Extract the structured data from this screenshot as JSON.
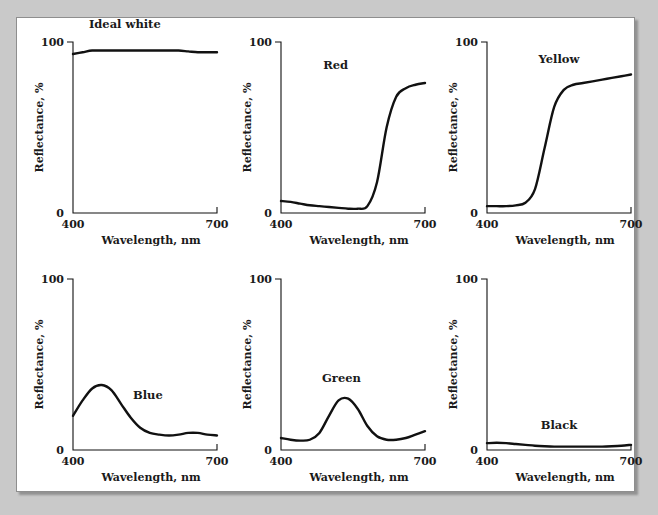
{
  "figure": {
    "background_color": "#c9c9c9",
    "page_color": "#ffffff",
    "border_color": "#8e8e8e",
    "curve_color": "#111111"
  },
  "chart_data": [
    {
      "type": "line",
      "title": "Ideal white",
      "xlabel": "Wavelength, nm",
      "ylabel": "Reflectance, %",
      "xlim": [
        400,
        700
      ],
      "ylim": [
        0,
        100
      ],
      "xticks": [
        "400",
        "700"
      ],
      "yticks": [
        "0",
        "100"
      ],
      "grid": false,
      "legend": "none",
      "x": [
        400,
        420,
        440,
        460,
        480,
        500,
        520,
        540,
        560,
        580,
        600,
        620,
        640,
        660,
        680,
        700
      ],
      "values": [
        93,
        94,
        95,
        95,
        95,
        95,
        95,
        95,
        95,
        95,
        95,
        95,
        94.5,
        94,
        94,
        94
      ]
    },
    {
      "type": "line",
      "title": "Red",
      "xlabel": "Wavelength, nm",
      "ylabel": "Reflectance, %",
      "xlim": [
        400,
        700
      ],
      "ylim": [
        0,
        100
      ],
      "xticks": [
        "400",
        "700"
      ],
      "yticks": [
        "0",
        "100"
      ],
      "grid": false,
      "legend": "none",
      "x": [
        400,
        420,
        440,
        460,
        480,
        500,
        520,
        540,
        560,
        580,
        600,
        620,
        640,
        660,
        680,
        700
      ],
      "values": [
        7,
        6.5,
        5.5,
        4.5,
        4,
        3.5,
        3,
        2.5,
        2.5,
        4,
        18,
        50,
        68,
        73,
        75,
        76
      ]
    },
    {
      "type": "line",
      "title": "Yellow",
      "xlabel": "Wavelength, nm",
      "ylabel": "Reflectance, %",
      "xlim": [
        400,
        700
      ],
      "ylim": [
        0,
        100
      ],
      "xticks": [
        "400",
        "700"
      ],
      "yticks": [
        "0",
        "100"
      ],
      "grid": false,
      "legend": "none",
      "x": [
        400,
        420,
        440,
        460,
        480,
        500,
        520,
        540,
        560,
        580,
        600,
        620,
        640,
        660,
        680,
        700
      ],
      "values": [
        4,
        4,
        4,
        4.5,
        6,
        14,
        38,
        62,
        72,
        75,
        76,
        77,
        78,
        79,
        80,
        81
      ]
    },
    {
      "type": "line",
      "title": "Blue",
      "xlabel": "Wavelength, nm",
      "ylabel": "Reflectance, %",
      "xlim": [
        400,
        700
      ],
      "ylim": [
        0,
        100
      ],
      "xticks": [
        "400",
        "700"
      ],
      "yticks": [
        "0",
        "100"
      ],
      "grid": false,
      "legend": "none",
      "x": [
        400,
        420,
        440,
        460,
        480,
        500,
        520,
        540,
        560,
        580,
        600,
        620,
        640,
        660,
        680,
        700
      ],
      "values": [
        20,
        29,
        36,
        38,
        35,
        27,
        19,
        13,
        10,
        9,
        8.5,
        9,
        10,
        10,
        9,
        8.5
      ]
    },
    {
      "type": "line",
      "title": "Green",
      "xlabel": "Wavelength, nm",
      "ylabel": "Reflectance, %",
      "xlim": [
        400,
        700
      ],
      "ylim": [
        0,
        100
      ],
      "xticks": [
        "400",
        "700"
      ],
      "yticks": [
        "0",
        "100"
      ],
      "grid": false,
      "legend": "none",
      "x": [
        400,
        420,
        440,
        460,
        480,
        500,
        520,
        540,
        560,
        580,
        600,
        620,
        640,
        660,
        680,
        700
      ],
      "values": [
        7,
        6,
        5.5,
        6,
        10,
        20,
        29,
        30,
        24,
        14,
        8,
        6,
        6,
        7,
        9,
        11
      ]
    },
    {
      "type": "line",
      "title": "Black",
      "xlabel": "Wavelength, nm",
      "ylabel": "Reflectance, %",
      "xlim": [
        400,
        700
      ],
      "ylim": [
        0,
        100
      ],
      "xticks": [
        "400",
        "700"
      ],
      "yticks": [
        "0",
        "100"
      ],
      "grid": false,
      "legend": "none",
      "x": [
        400,
        420,
        440,
        460,
        480,
        500,
        520,
        540,
        560,
        580,
        600,
        620,
        640,
        660,
        680,
        700
      ],
      "values": [
        4,
        4.2,
        4,
        3.5,
        3,
        2.5,
        2.2,
        2,
        2,
        2,
        2,
        2,
        2,
        2.2,
        2.5,
        3
      ]
    }
  ]
}
